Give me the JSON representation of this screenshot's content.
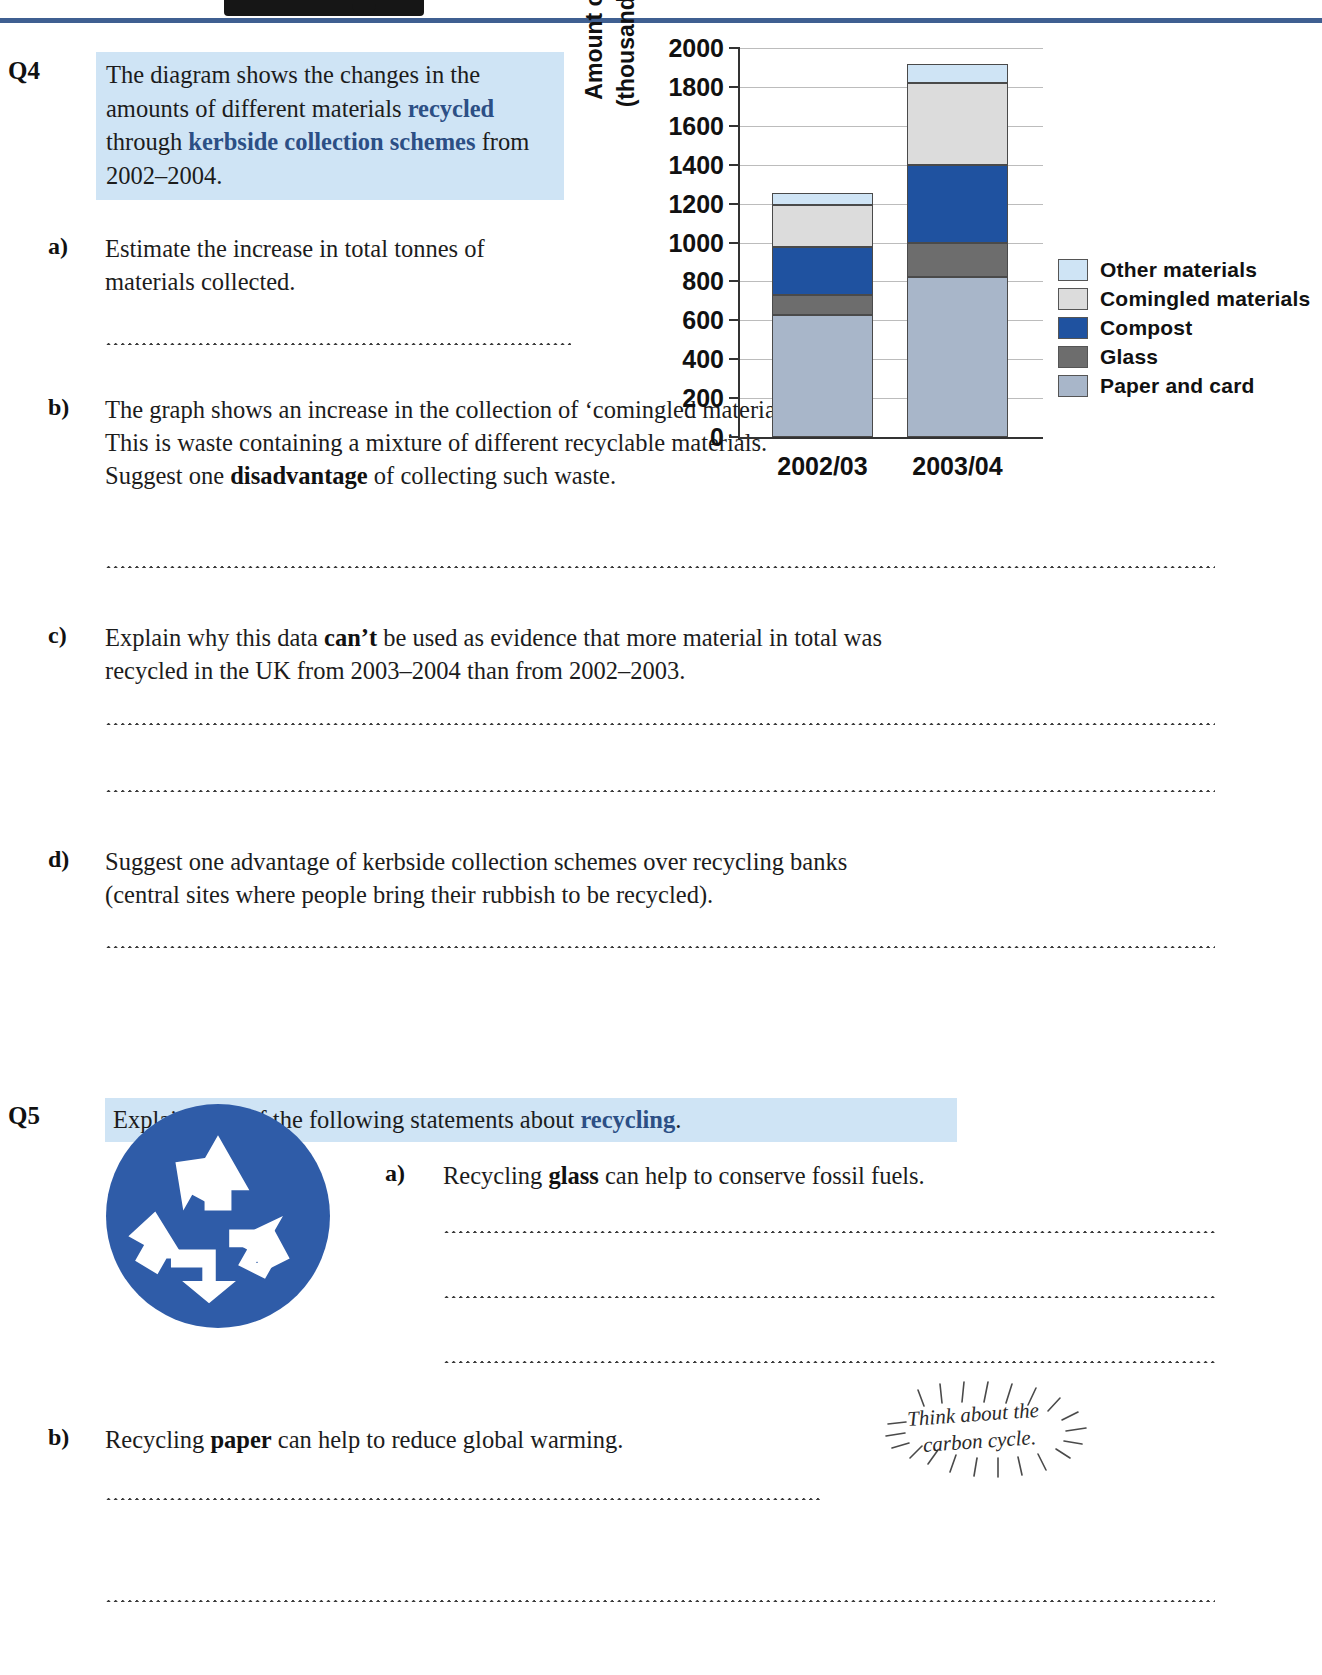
{
  "header": {
    "decor": "black-tab"
  },
  "q4": {
    "number": "Q4",
    "intro_pre": "The diagram shows the changes in the amounts of different materials ",
    "intro_b1": "recycled",
    "intro_mid": " through ",
    "intro_b2": "kerbside collection schemes",
    "intro_post": " from 2002–2004.",
    "parts": {
      "a_label": "a)",
      "a_text": "Estimate the increase in total tonnes of materials collected.",
      "b_label": "b)",
      "b_text_pre": "The graph shows an increase in the collection of ‘comingled materials’.  This is waste containing a mixture of different recyclable materials.  Suggest one ",
      "b_bold": "disadvantage",
      "b_text_post": " of collecting such waste.",
      "c_label": "c)",
      "c_text_pre": "Explain why this data ",
      "c_bold": "can’t",
      "c_text_post": " be used as evidence that more material in total was recycled in the UK from 2003–2004 than from 2002–2003.",
      "d_label": "d)",
      "d_text": "Suggest one advantage of kerbside collection schemes over recycling banks (central sites where people bring their rubbish to be recycled)."
    }
  },
  "q5": {
    "number": "Q5",
    "intro_pre": "Explain each of the following statements about ",
    "intro_bold": "recycling",
    "intro_post": ".",
    "logo_name": "recycling-logo",
    "parts": {
      "a_label": "a)",
      "a_pre": "Recycling ",
      "a_bold": "glass",
      "a_post": " can help to conserve fossil fuels.",
      "b_label": "b)",
      "b_pre": "Recycling ",
      "b_bold": "paper",
      "b_post": " can help to reduce global warming."
    },
    "hint_line1": "Think about the",
    "hint_line2": "carbon cycle."
  },
  "chart_data": {
    "type": "bar",
    "subtype": "stacked",
    "title": "",
    "xlabel": "",
    "ylabel": "Amount of waste (thousand tonnes)",
    "ylabel_line1": "Amount of waste",
    "ylabel_line2": "(thousand tonnes)",
    "ylim": [
      0,
      2000
    ],
    "yticks": [
      0,
      200,
      400,
      600,
      800,
      1000,
      1200,
      1400,
      1600,
      1800,
      2000
    ],
    "ytick_labels": [
      "0",
      "200",
      "400",
      "600",
      "800",
      "1000",
      "1200",
      "1400",
      "1600",
      "1800",
      "2000"
    ],
    "grid": true,
    "legend_position": "right",
    "categories": [
      "2002/03",
      "2003/04"
    ],
    "series": [
      {
        "name": "Paper and card",
        "values": [
          625,
          825
        ],
        "color": "#a8b6c9"
      },
      {
        "name": "Glass",
        "values": [
          105,
          175
        ],
        "color": "#6d6d6d"
      },
      {
        "name": "Compost",
        "values": [
          245,
          400
        ],
        "color": "#1f52a0"
      },
      {
        "name": "Comingled materials",
        "values": [
          220,
          420
        ],
        "color": "#dcdcdc"
      },
      {
        "name": "Other materials",
        "values": [
          60,
          100
        ],
        "color": "#cfe4f5"
      }
    ],
    "legend_order": [
      "Other materials",
      "Comingled materials",
      "Compost",
      "Glass",
      "Paper and card"
    ],
    "totals": [
      1255,
      1920
    ]
  },
  "colors": {
    "rule": "#3f5f91",
    "highlight": "#cfe4f5",
    "accent_blue": "#2c4f85",
    "logo_blue": "#2f5ca8"
  }
}
